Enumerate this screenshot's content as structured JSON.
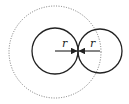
{
  "diagram": {
    "labels": {
      "left_radius": "r",
      "right_radius": "r"
    },
    "colors": {
      "stroke": "#222222",
      "dotted": "#777777",
      "background": "#ffffff"
    },
    "shapes": {
      "dotted_circle": {
        "cx": 55,
        "cy": 52,
        "r": 46
      },
      "left_circle": {
        "cx": 55,
        "cy": 51,
        "r": 23
      },
      "right_circle": {
        "cx": 100,
        "cy": 51,
        "r": 22
      }
    }
  }
}
